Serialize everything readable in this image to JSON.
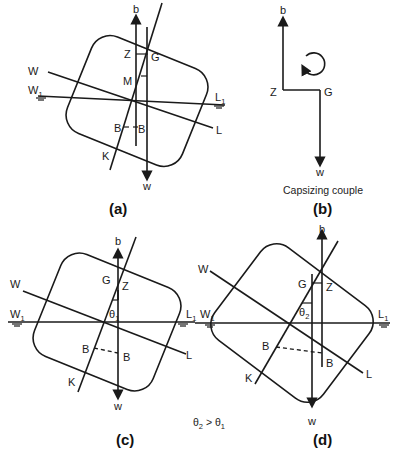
{
  "figure": {
    "panels": {
      "a": {
        "caption": "(a)",
        "labels": {
          "b": "b",
          "w": "w",
          "Z": "Z",
          "G": "G",
          "M": "M",
          "W": "W",
          "W1": "W",
          "W1_sub": "1",
          "L1": "L",
          "L1_sub": "1",
          "L": "L",
          "K": "K",
          "B_left": "B",
          "B_right": "B"
        }
      },
      "b": {
        "caption": "(b)",
        "title": "Capsizing couple",
        "labels": {
          "b": "b",
          "w": "w",
          "Z": "Z",
          "G": "G"
        }
      },
      "c": {
        "caption": "(c)",
        "labels": {
          "b": "b",
          "w": "w",
          "Z": "Z",
          "G": "G",
          "theta": "θ",
          "theta_sub": "1",
          "W": "W",
          "W1": "W",
          "W1_sub": "1",
          "L1": "L",
          "L1_sub": "1",
          "L": "L",
          "K": "K",
          "B_left": "B",
          "B_right": "B"
        }
      },
      "d": {
        "caption": "(d)",
        "labels": {
          "b": "b",
          "w": "w",
          "Z": "Z",
          "G": "G",
          "theta": "θ",
          "theta_sub": "2",
          "W": "W",
          "W1": "W",
          "W1_sub": "1",
          "L1": "L",
          "L1_sub": "1",
          "L": "L",
          "K": "K",
          "B_left": "B",
          "B_right": "B"
        }
      }
    },
    "comparison_note": {
      "lhs": "θ",
      "lhs_sub": "2",
      "op": " > ",
      "rhs": "θ",
      "rhs_sub": "1"
    }
  }
}
